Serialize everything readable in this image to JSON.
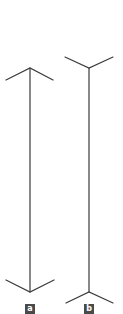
{
  "figure": {
    "line_color": "#3a3a3a",
    "label_bg": "#4a4a4a",
    "label_text_color": "#ffffff",
    "panels": [
      {
        "id": "a",
        "label": "a",
        "fin_style": "arrowheads-outward"
      },
      {
        "id": "b",
        "label": "b",
        "fin_style": "fins-inward"
      }
    ]
  }
}
